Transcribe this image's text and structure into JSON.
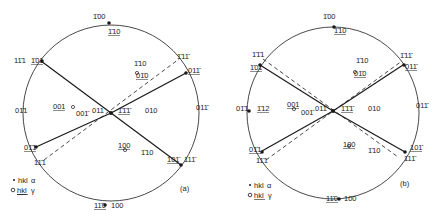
{
  "figures": [
    {
      "id": "a",
      "panel_label": "(a)",
      "center": [
        111,
        113
      ],
      "radius": 88,
      "poles": [
        {
          "text": "1̄00",
          "x": 93,
          "y": 19,
          "type": "alpha"
        },
        {
          "text": "1̄10",
          "x": 108,
          "y": 34,
          "type": "gamma",
          "underline": true
        },
        {
          "text": "11̄1",
          "x": 14,
          "y": 63,
          "type": "alpha"
        },
        {
          "text": "1̄01",
          "x": 31,
          "y": 63,
          "type": "gamma",
          "underline": true
        },
        {
          "text": "1̄10",
          "x": 134,
          "y": 66,
          "type": "alpha"
        },
        {
          "text": "01̄0",
          "x": 136,
          "y": 78,
          "type": "gamma",
          "underline": true
        },
        {
          "text": "1̄11̄",
          "x": 177,
          "y": 59,
          "type": "alpha"
        },
        {
          "text": "011̄",
          "x": 188,
          "y": 73,
          "type": "gamma",
          "underline": true
        },
        {
          "text": "01̄1",
          "x": 15,
          "y": 113,
          "type": "alpha"
        },
        {
          "text": "001",
          "x": 53,
          "y": 109,
          "type": "gamma",
          "underline": true
        },
        {
          "text": "001̄",
          "x": 76,
          "y": 116,
          "type": "alpha"
        },
        {
          "text": "011",
          "x": 92,
          "y": 113,
          "type": "alpha"
        },
        {
          "text": "1̄1̄1̄",
          "x": 118,
          "y": 113,
          "type": "gamma",
          "underline": true
        },
        {
          "text": "010",
          "x": 145,
          "y": 113,
          "type": "alpha"
        },
        {
          "text": "011̄",
          "x": 196,
          "y": 110,
          "type": "alpha"
        },
        {
          "text": "01̄1",
          "x": 24,
          "y": 150,
          "type": "gamma",
          "underline": true
        },
        {
          "text": "11̄1",
          "x": 34,
          "y": 165,
          "type": "alpha"
        },
        {
          "text": "100",
          "x": 118,
          "y": 148,
          "type": "gamma",
          "underline": true
        },
        {
          "text": "1̄10",
          "x": 141,
          "y": 155,
          "type": "alpha"
        },
        {
          "text": "101̄",
          "x": 167,
          "y": 162,
          "type": "gamma",
          "underline": true
        },
        {
          "text": "111̄",
          "x": 184,
          "y": 162,
          "type": "alpha"
        },
        {
          "text": "11̄0",
          "x": 94,
          "y": 208,
          "type": "gamma",
          "underline": true
        },
        {
          "text": "100",
          "x": 111,
          "y": 208,
          "type": "alpha"
        }
      ],
      "lines": [
        {
          "style": "solid",
          "from": [
            41,
            61
          ],
          "to": [
            111,
            113
          ]
        },
        {
          "style": "solid",
          "from": [
            111,
            113
          ],
          "to": [
            181,
            165
          ]
        },
        {
          "style": "solid",
          "from": [
            36,
            147
          ],
          "to": [
            111,
            113
          ]
        },
        {
          "style": "solid",
          "from": [
            111,
            113
          ],
          "to": [
            186,
            73
          ]
        },
        {
          "style": "dashed",
          "from": [
            44,
            160
          ],
          "to": [
            179,
            59
          ]
        }
      ]
    },
    {
      "id": "b",
      "panel_label": "(b)",
      "center": [
        333,
        113
      ],
      "radius": 86,
      "poles": [
        {
          "text": "1̄00",
          "x": 323,
          "y": 19,
          "type": "alpha"
        },
        {
          "text": "1̄10",
          "x": 334,
          "y": 33,
          "type": "gamma",
          "underline": true
        },
        {
          "text": "1̄1̄1",
          "x": 252,
          "y": 57,
          "type": "alpha"
        },
        {
          "text": "1̄01",
          "x": 250,
          "y": 70,
          "type": "gamma",
          "underline": true
        },
        {
          "text": "1̄10",
          "x": 356,
          "y": 63,
          "type": "alpha"
        },
        {
          "text": "01̄0",
          "x": 354,
          "y": 76,
          "type": "gamma",
          "underline": true
        },
        {
          "text": "1̄11̄",
          "x": 400,
          "y": 58,
          "type": "alpha"
        },
        {
          "text": "011̄",
          "x": 405,
          "y": 69,
          "type": "gamma",
          "underline": true
        },
        {
          "text": "01̄1",
          "x": 236,
          "y": 111,
          "type": "alpha"
        },
        {
          "text": "1̄12",
          "x": 257,
          "y": 111,
          "type": "gamma",
          "underline": true
        },
        {
          "text": "001",
          "x": 287,
          "y": 107,
          "type": "gamma",
          "underline": true
        },
        {
          "text": "001̄",
          "x": 301,
          "y": 115,
          "type": "alpha"
        },
        {
          "text": "011",
          "x": 315,
          "y": 111,
          "type": "alpha"
        },
        {
          "text": "1̄1̄1̄",
          "x": 341,
          "y": 111,
          "type": "gamma",
          "underline": true
        },
        {
          "text": "010",
          "x": 368,
          "y": 111,
          "type": "alpha"
        },
        {
          "text": "011̄",
          "x": 416,
          "y": 108,
          "type": "alpha"
        },
        {
          "text": "01̄1",
          "x": 249,
          "y": 152,
          "type": "gamma",
          "underline": true
        },
        {
          "text": "11̄1",
          "x": 256,
          "y": 163,
          "type": "alpha"
        },
        {
          "text": "100",
          "x": 343,
          "y": 147,
          "type": "gamma",
          "underline": true
        },
        {
          "text": "1̄10",
          "x": 368,
          "y": 153,
          "type": "alpha"
        },
        {
          "text": "101̄",
          "x": 410,
          "y": 150,
          "type": "gamma",
          "underline": true
        },
        {
          "text": "111̄",
          "x": 404,
          "y": 161,
          "type": "alpha"
        },
        {
          "text": "11̄0",
          "x": 326,
          "y": 201,
          "type": "gamma",
          "underline": true
        },
        {
          "text": "100",
          "x": 344,
          "y": 201,
          "type": "alpha"
        }
      ],
      "lines": [
        {
          "style": "solid",
          "from": [
            260,
            65
          ],
          "to": [
            333,
            111
          ]
        },
        {
          "style": "solid",
          "from": [
            333,
            111
          ],
          "to": [
            405,
            152
          ]
        },
        {
          "style": "solid",
          "from": [
            262,
            151
          ],
          "to": [
            333,
            111
          ]
        },
        {
          "style": "solid",
          "from": [
            333,
            111
          ],
          "to": [
            403,
            65
          ]
        },
        {
          "style": "dashed",
          "from": [
            263,
            59
          ],
          "to": [
            398,
            157
          ]
        },
        {
          "style": "dashed",
          "from": [
            266,
            160
          ],
          "to": [
            402,
            61
          ]
        }
      ]
    }
  ],
  "legends": [
    {
      "panel": "a",
      "alpha_text": "hkl",
      "alpha_symbol": "α",
      "gamma_text": "hkl",
      "gamma_symbol": "γ"
    },
    {
      "panel": "b",
      "alpha_text": "hkl",
      "alpha_symbol": "α",
      "gamma_text": "hkl",
      "gamma_symbol": "γ"
    }
  ],
  "colors": {
    "ink": "#1a1a1a",
    "background": "#ffffff"
  }
}
